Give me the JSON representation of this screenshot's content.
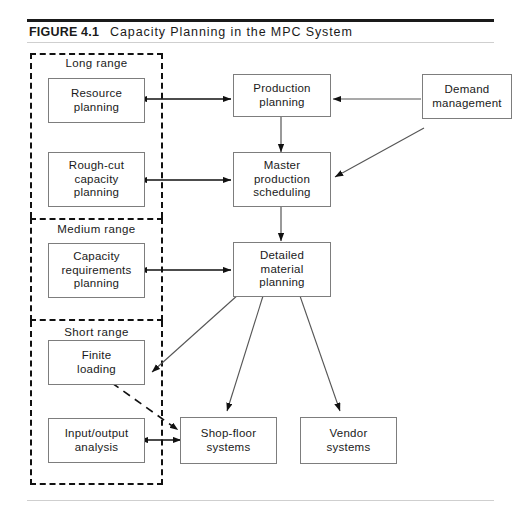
{
  "figure": {
    "label": "FIGURE 4.1",
    "title": "Capacity Planning in the MPC System"
  },
  "ranges": [
    {
      "id": "long-range",
      "label": "Long range"
    },
    {
      "id": "medium-range",
      "label": "Medium range"
    },
    {
      "id": "short-range",
      "label": "Short range"
    }
  ],
  "nodes": {
    "resource_planning": "Resource\nplanning",
    "rough_cut": "Rough-cut\ncapacity\nplanning",
    "capacity_requirements": "Capacity\nrequirements\nplanning",
    "finite_loading": "Finite\nloading",
    "input_output": "Input/output\nanalysis",
    "production_planning": "Production\nplanning",
    "master_production_scheduling": "Master\nproduction\nscheduling",
    "detailed_material_planning": "Detailed\nmaterial\nplanning",
    "shop_floor_systems": "Shop-floor\nsystems",
    "vendor_systems": "Vendor\nsystems",
    "demand_management": "Demand\nmanagement"
  },
  "node_lines": {
    "resource_planning": [
      "Resource",
      "planning"
    ],
    "rough_cut": [
      "Rough-cut",
      "capacity",
      "planning"
    ],
    "capacity_requirements": [
      "Capacity",
      "requirements",
      "planning"
    ],
    "finite_loading": [
      "Finite",
      "loading"
    ],
    "input_output": [
      "Input/output",
      "analysis"
    ],
    "production_planning": [
      "Production",
      "planning"
    ],
    "master_production_scheduling": [
      "Master",
      "production",
      "scheduling"
    ],
    "detailed_material_planning": [
      "Detailed",
      "material",
      "planning"
    ],
    "shop_floor_systems": [
      "Shop-floor",
      "systems"
    ],
    "vendor_systems": [
      "Vendor",
      "systems"
    ],
    "demand_management": [
      "Demand",
      "management"
    ]
  },
  "colors": {
    "ink": "#1a1a1a",
    "box_border": "#7d7d7d",
    "dashed_border": "#111111",
    "rule_dark": "#1a1a1a",
    "rule_light": "#cfcfcf",
    "page_background": "#ffffff"
  },
  "connections": [
    {
      "from": "resource_planning",
      "to": "production_planning",
      "style": "double-arrow"
    },
    {
      "from": "rough_cut",
      "to": "master_production_scheduling",
      "style": "double-arrow"
    },
    {
      "from": "capacity_requirements",
      "to": "detailed_material_planning",
      "style": "double-arrow"
    },
    {
      "from": "input_output",
      "to": "shop_floor_systems",
      "style": "double-arrow"
    },
    {
      "from": "demand_management",
      "to": "production_planning",
      "style": "arrow"
    },
    {
      "from": "demand_management",
      "to": "master_production_scheduling",
      "style": "arrow"
    },
    {
      "from": "production_planning",
      "to": "master_production_scheduling",
      "style": "arrow"
    },
    {
      "from": "master_production_scheduling",
      "to": "detailed_material_planning",
      "style": "arrow"
    },
    {
      "from": "detailed_material_planning",
      "to": "finite_loading",
      "style": "arrow"
    },
    {
      "from": "detailed_material_planning",
      "to": "shop_floor_systems",
      "style": "arrow"
    },
    {
      "from": "detailed_material_planning",
      "to": "vendor_systems",
      "style": "arrow"
    },
    {
      "from": "finite_loading",
      "to": "shop_floor_systems",
      "style": "dashed-arrow"
    }
  ]
}
